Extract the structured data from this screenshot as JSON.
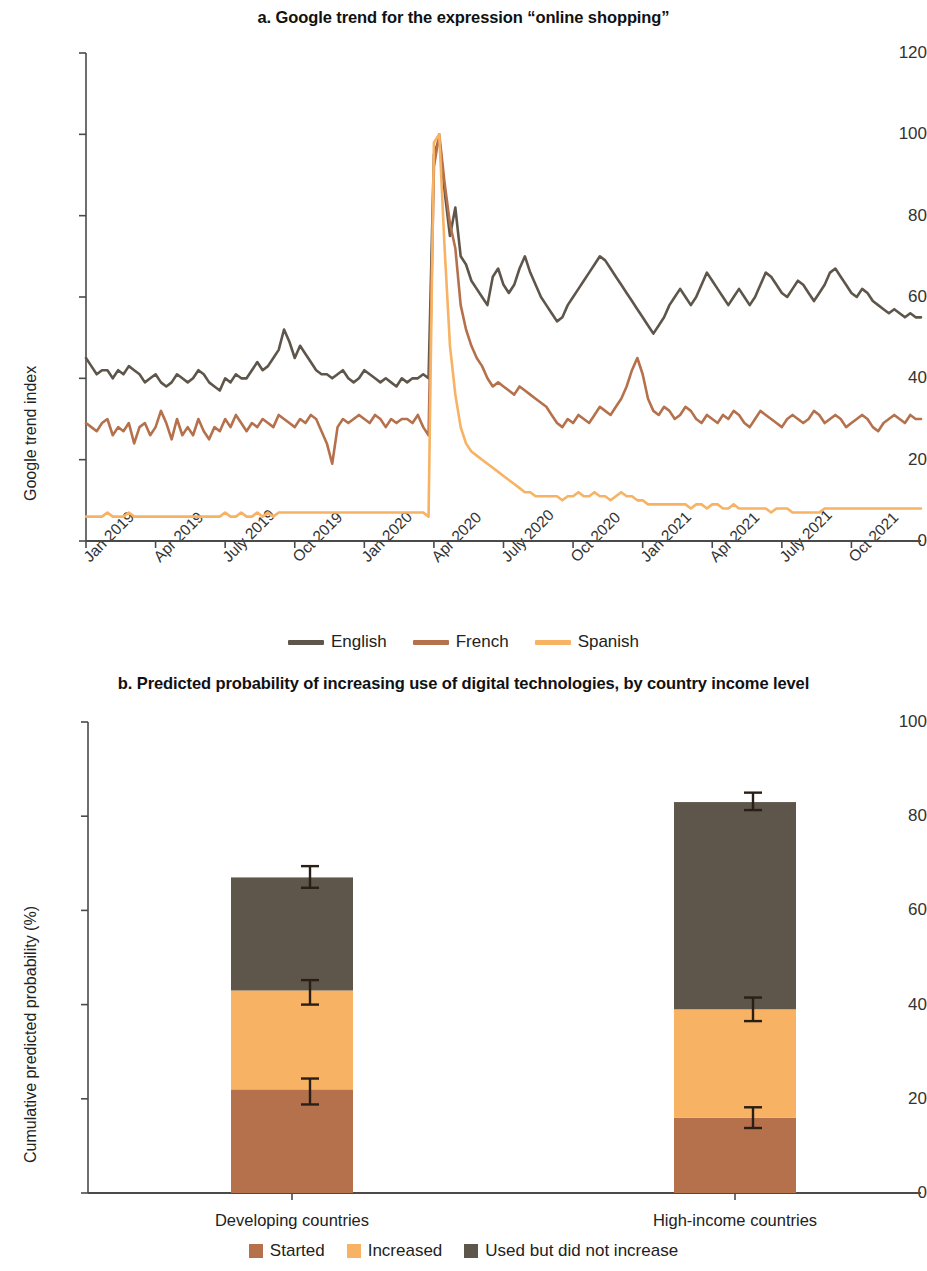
{
  "figure": {
    "panel_a_title": "a. Google trend for the expression “online shopping”",
    "panel_b_title": "b. Predicted probability of increasing use of digital technologies, by country income level"
  },
  "colors": {
    "english": "#5e564a",
    "french": "#b5714c",
    "spanish": "#f7b263",
    "started": "#b5714c",
    "increased": "#f7b263",
    "used_not_increase": "#5e564a",
    "axis": "#4a4a4a",
    "error_bar": "#2a1f16"
  },
  "chart_data": [
    {
      "type": "line",
      "title": "a. Google trend for the expression “online shopping”",
      "xlabel": "",
      "ylabel": "Google trend index",
      "ylim": [
        0,
        120
      ],
      "yticks": [
        0,
        20,
        40,
        60,
        80,
        100,
        120
      ],
      "xticks": [
        "Jan 2019",
        "Apr 2019",
        "July 2019",
        "Oct 2019",
        "Jan 2020",
        "Apr 2020",
        "July 2020",
        "Oct 2020",
        "Jan 2021",
        "Apr 2021",
        "July 2021",
        "Oct 2021"
      ],
      "xtick_index": [
        0,
        13,
        26,
        39,
        52,
        65,
        78,
        91,
        104,
        117,
        130,
        143
      ],
      "grid": false,
      "legend_position": "bottom",
      "n_points": 157,
      "series": [
        {
          "name": "English",
          "color": "#5e564a",
          "values": [
            45,
            43,
            41,
            42,
            42,
            40,
            42,
            41,
            43,
            42,
            41,
            39,
            40,
            41,
            39,
            38,
            39,
            41,
            40,
            39,
            40,
            42,
            41,
            39,
            38,
            37,
            40,
            39,
            41,
            40,
            40,
            42,
            44,
            42,
            43,
            45,
            47,
            52,
            49,
            45,
            48,
            46,
            44,
            42,
            41,
            41,
            40,
            41,
            42,
            40,
            39,
            40,
            42,
            41,
            40,
            39,
            40,
            39,
            38,
            40,
            39,
            40,
            40,
            41,
            40,
            95,
            99,
            86,
            75,
            82,
            70,
            68,
            64,
            62,
            60,
            58,
            65,
            67,
            63,
            61,
            63,
            67,
            70,
            66,
            63,
            60,
            58,
            56,
            54,
            55,
            58,
            60,
            62,
            64,
            66,
            68,
            70,
            69,
            67,
            65,
            63,
            61,
            59,
            57,
            55,
            53,
            51,
            53,
            55,
            58,
            60,
            62,
            60,
            58,
            60,
            63,
            66,
            64,
            62,
            60,
            58,
            60,
            62,
            60,
            58,
            60,
            63,
            66,
            65,
            63,
            61,
            60,
            62,
            64,
            63,
            61,
            59,
            61,
            63,
            66,
            67,
            65,
            63,
            61,
            60,
            62,
            61,
            59,
            58,
            57,
            56,
            57,
            56,
            55,
            56,
            55,
            55
          ]
        },
        {
          "name": "French",
          "color": "#b5714c",
          "values": [
            29,
            28,
            27,
            29,
            30,
            26,
            28,
            27,
            29,
            24,
            28,
            29,
            26,
            28,
            32,
            29,
            25,
            30,
            26,
            28,
            26,
            30,
            27,
            25,
            28,
            27,
            30,
            28,
            31,
            29,
            27,
            29,
            28,
            30,
            29,
            28,
            31,
            30,
            29,
            28,
            30,
            29,
            31,
            30,
            27,
            24,
            19,
            28,
            30,
            29,
            30,
            31,
            30,
            29,
            31,
            30,
            28,
            30,
            29,
            30,
            30,
            29,
            31,
            28,
            26,
            92,
            100,
            88,
            78,
            72,
            58,
            52,
            48,
            45,
            43,
            40,
            38,
            39,
            38,
            37,
            36,
            38,
            37,
            36,
            35,
            34,
            33,
            31,
            29,
            28,
            30,
            29,
            31,
            30,
            29,
            31,
            33,
            32,
            31,
            33,
            35,
            38,
            42,
            45,
            41,
            35,
            32,
            31,
            33,
            32,
            30,
            31,
            33,
            32,
            30,
            29,
            31,
            30,
            29,
            31,
            30,
            32,
            31,
            29,
            28,
            30,
            32,
            31,
            30,
            29,
            28,
            30,
            31,
            30,
            29,
            30,
            32,
            31,
            29,
            30,
            31,
            30,
            28,
            29,
            30,
            31,
            30,
            28,
            27,
            29,
            30,
            31,
            30,
            29,
            31,
            30,
            30
          ]
        },
        {
          "name": "Spanish",
          "color": "#f7b263",
          "values": [
            6,
            6,
            6,
            6,
            7,
            6,
            6,
            6,
            7,
            6,
            6,
            6,
            6,
            6,
            6,
            6,
            6,
            6,
            6,
            6,
            6,
            6,
            6,
            6,
            6,
            6,
            7,
            6,
            6,
            7,
            6,
            6,
            7,
            6,
            7,
            6,
            7,
            7,
            7,
            7,
            7,
            7,
            7,
            7,
            7,
            7,
            7,
            7,
            7,
            7,
            7,
            7,
            7,
            7,
            7,
            7,
            7,
            7,
            7,
            7,
            7,
            7,
            7,
            7,
            6,
            98,
            100,
            72,
            48,
            36,
            28,
            24,
            22,
            21,
            20,
            19,
            18,
            17,
            16,
            15,
            14,
            13,
            12,
            12,
            11,
            11,
            11,
            11,
            11,
            10,
            11,
            11,
            12,
            11,
            11,
            12,
            11,
            11,
            10,
            11,
            12,
            11,
            11,
            10,
            10,
            9,
            9,
            9,
            9,
            9,
            9,
            9,
            9,
            8,
            9,
            9,
            8,
            9,
            9,
            8,
            8,
            9,
            8,
            8,
            8,
            8,
            8,
            8,
            7,
            8,
            8,
            8,
            7,
            7,
            7,
            7,
            7,
            7,
            8,
            8,
            8,
            8,
            8,
            8,
            8,
            8,
            8,
            8,
            8,
            8,
            8,
            8,
            8,
            8,
            8,
            8,
            8
          ]
        }
      ],
      "legend": [
        "English",
        "French",
        "Spanish"
      ]
    },
    {
      "type": "bar",
      "subtype": "stacked",
      "title": "b. Predicted probability of increasing use of digital technologies, by country income level",
      "xlabel": "",
      "ylabel": "Cumulative predicted probability (%)",
      "ylim": [
        0,
        100
      ],
      "yticks": [
        0,
        20,
        40,
        60,
        80,
        100
      ],
      "categories": [
        "Developing countries",
        "High-income countries"
      ],
      "grid": false,
      "legend_position": "bottom",
      "series": [
        {
          "name": "Started",
          "color": "#b5714c",
          "values": [
            22,
            16
          ]
        },
        {
          "name": "Increased",
          "color": "#f7b263",
          "values": [
            21,
            23
          ]
        },
        {
          "name": "Used but did not increase",
          "color": "#5e564a",
          "values": [
            24,
            44
          ]
        }
      ],
      "cumulative": [
        [
          22,
          43,
          67
        ],
        [
          16,
          39,
          83
        ]
      ],
      "error_bars": [
        {
          "category": "Developing countries",
          "at": 22,
          "low": 18.8,
          "high": 24.3
        },
        {
          "category": "Developing countries",
          "at": 43,
          "low": 40.0,
          "high": 45.2
        },
        {
          "category": "Developing countries",
          "at": 67,
          "low": 64.8,
          "high": 69.4
        },
        {
          "category": "High-income countries",
          "at": 16,
          "low": 13.8,
          "high": 18.2
        },
        {
          "category": "High-income countries",
          "at": 39,
          "low": 36.5,
          "high": 41.5
        },
        {
          "category": "High-income countries",
          "at": 83,
          "low": 81.3,
          "high": 85.0
        }
      ],
      "legend": [
        "Started",
        "Increased",
        "Used but did not increase"
      ]
    }
  ]
}
